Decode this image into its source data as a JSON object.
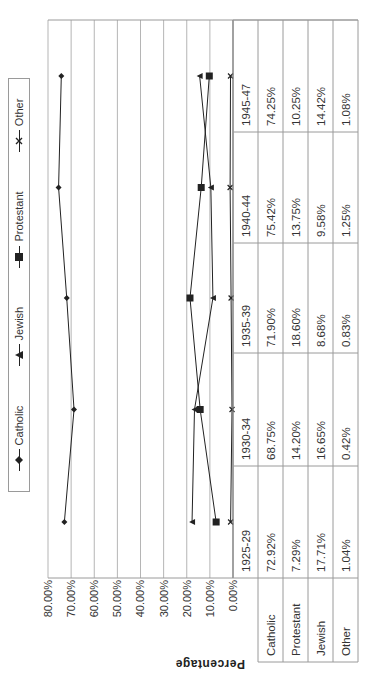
{
  "chart_data": {
    "type": "line",
    "orientation_note": "figure rotated 90 degrees counter-clockwise on screen",
    "title": "",
    "xlabel": "",
    "ylabel": "Percentage",
    "ylim": [
      0,
      80
    ],
    "yticks": [
      "80.00%",
      "70.00%",
      "60.00%",
      "50.00%",
      "40.00%",
      "30.00%",
      "20.00%",
      "10.00%",
      "0.00%"
    ],
    "grid": true,
    "legend_position": "top",
    "categories": [
      "1925-29",
      "1930-34",
      "1935-39",
      "1940-44",
      "1945-47"
    ],
    "series": [
      {
        "name": "Catholic",
        "marker": "diamond",
        "values": [
          72.92,
          68.75,
          71.9,
          75.42,
          74.25
        ],
        "labels": [
          "72.92%",
          "68.75%",
          "71.90%",
          "75.42%",
          "74.25%"
        ]
      },
      {
        "name": "Protestant",
        "marker": "square",
        "values": [
          7.29,
          14.2,
          18.6,
          13.75,
          10.25
        ],
        "labels": [
          "7.29%",
          "14.20%",
          "18.60%",
          "13.75%",
          "10.25%"
        ]
      },
      {
        "name": "Jewish",
        "marker": "triangle",
        "values": [
          17.71,
          16.65,
          8.68,
          9.58,
          14.42
        ],
        "labels": [
          "17.71%",
          "16.65%",
          "8.68%",
          "9.58%",
          "14.42%"
        ]
      },
      {
        "name": "Other",
        "marker": "x",
        "values": [
          1.04,
          0.42,
          0.83,
          1.25,
          1.08
        ],
        "labels": [
          "1.04%",
          "0.42%",
          "0.83%",
          "1.25%",
          "1.08%"
        ]
      }
    ]
  },
  "legend": {
    "items": [
      {
        "label": "Catholic",
        "marker": "diamond-icon"
      },
      {
        "label": "Jewish",
        "marker": "triangle-icon"
      },
      {
        "label": "Protestant",
        "marker": "square-icon"
      },
      {
        "label": "Other",
        "marker": "x-icon"
      }
    ]
  },
  "axis": {
    "ylabel": "Percentage",
    "ticks": [
      "80.00%",
      "70.00%",
      "60.00%",
      "50.00%",
      "40.00%",
      "30.00%",
      "20.00%",
      "10.00%",
      "0.00%"
    ]
  },
  "table": {
    "periods": [
      "1925-29",
      "1930-34",
      "1935-39",
      "1940-44",
      "1945-47"
    ],
    "rows": [
      {
        "label": "Catholic",
        "cells": [
          "72.92%",
          "68.75%",
          "71.90%",
          "75.42%",
          "74.25%"
        ]
      },
      {
        "label": "Protestant",
        "cells": [
          "7.29%",
          "14.20%",
          "18.60%",
          "13.75%",
          "10.25%"
        ]
      },
      {
        "label": "Jewish",
        "cells": [
          "17.71%",
          "16.65%",
          "8.68%",
          "9.58%",
          "14.42%"
        ]
      },
      {
        "label": "Other",
        "cells": [
          "1.04%",
          "0.42%",
          "0.83%",
          "1.25%",
          "1.08%"
        ]
      }
    ]
  },
  "colors": {
    "line": "#222222",
    "grid": "#b5b5b5",
    "border": "#9a9a9a"
  }
}
